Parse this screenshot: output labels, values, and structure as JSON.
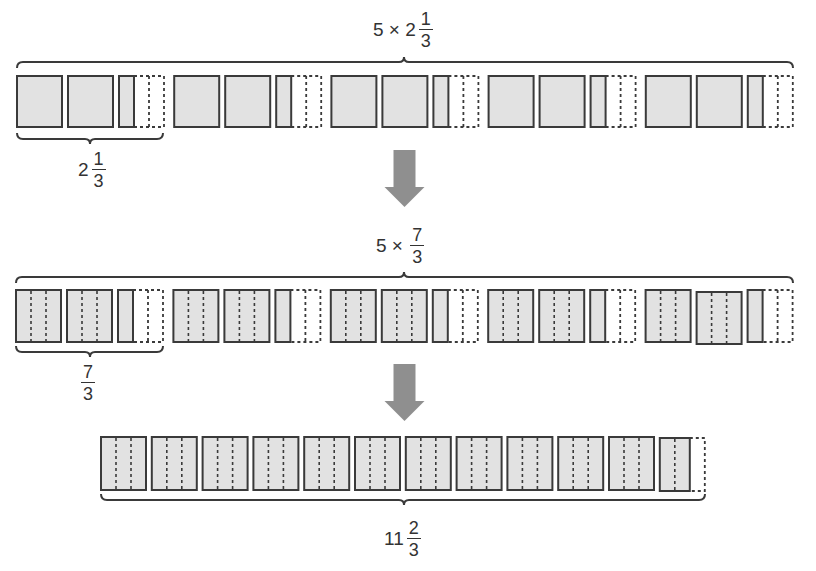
{
  "colors": {
    "fill": "#e2e2e2",
    "stroke": "#3a3a3a",
    "arrow": "#8f8f8f",
    "background": "#ffffff"
  },
  "labels": {
    "top": {
      "prefix": "5 ×",
      "whole": "2",
      "num": "1",
      "den": "3"
    },
    "top_group": {
      "whole": "2",
      "num": "1",
      "den": "3"
    },
    "middle": {
      "prefix": "5 ×",
      "whole": "",
      "num": "7",
      "den": "3"
    },
    "middle_group": {
      "whole": "",
      "num": "7",
      "den": "3"
    },
    "bottom": {
      "whole": "11",
      "num": "2",
      "den": "3"
    }
  },
  "rows": {
    "top": {
      "groups": 5,
      "full_squares_per_group": 2,
      "shaded_thirds_extra": 1,
      "unshaded_thirds_extra": 2,
      "third_lines": false
    },
    "middle": {
      "groups": 5,
      "full_squares_per_group": 2,
      "shaded_thirds_extra": 1,
      "unshaded_thirds_extra": 2,
      "third_lines": true
    },
    "bottom": {
      "full_squares": 11,
      "partial_shaded_thirds": 2,
      "partial_unshaded_thirds": 1,
      "third_lines": true
    }
  },
  "icons": [
    "down-arrow-icon",
    "down-arrow-icon"
  ]
}
